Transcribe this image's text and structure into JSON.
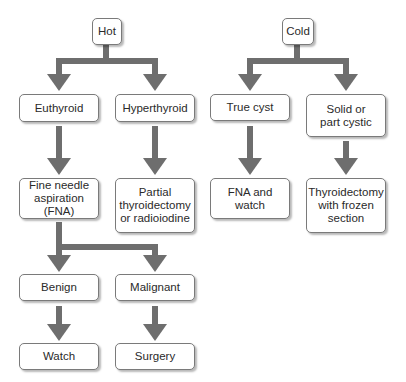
{
  "diagram": {
    "type": "flowchart",
    "arrow_color": "#6e6e6e",
    "box_border_color": "#7a7a7a",
    "nodes": {
      "hot": {
        "label": "Hot"
      },
      "cold": {
        "label": "Cold"
      },
      "euthyroid": {
        "label": "Euthyroid"
      },
      "hyperthyroid": {
        "label": "Hyperthyroid"
      },
      "true_cyst": {
        "label": "True cyst"
      },
      "solid": {
        "label": "Solid or\npart cystic"
      },
      "fna": {
        "label": "Fine needle\naspiration (FNA)"
      },
      "partial": {
        "label": "Partial\nthyroidectomy\nor radioiodine"
      },
      "fna_watch": {
        "label": "FNA and\nwatch"
      },
      "thyroidectomy": {
        "label": "Thyroidectomy\nwith frozen\nsection"
      },
      "benign": {
        "label": "Benign"
      },
      "malignant": {
        "label": "Malignant"
      },
      "watch": {
        "label": "Watch"
      },
      "surgery": {
        "label": "Surgery"
      }
    },
    "edges": [
      {
        "from": "Hot",
        "to": "Euthyroid"
      },
      {
        "from": "Hot",
        "to": "Hyperthyroid"
      },
      {
        "from": "Cold",
        "to": "True cyst"
      },
      {
        "from": "Cold",
        "to": "Solid or part cystic"
      },
      {
        "from": "Euthyroid",
        "to": "Fine needle aspiration (FNA)"
      },
      {
        "from": "Hyperthyroid",
        "to": "Partial thyroidectomy or radioiodine"
      },
      {
        "from": "True cyst",
        "to": "FNA and watch"
      },
      {
        "from": "Solid or part cystic",
        "to": "Thyroidectomy with frozen section"
      },
      {
        "from": "Fine needle aspiration (FNA)",
        "to": "Benign"
      },
      {
        "from": "Fine needle aspiration (FNA)",
        "to": "Malignant"
      },
      {
        "from": "Benign",
        "to": "Watch"
      },
      {
        "from": "Malignant",
        "to": "Surgery"
      }
    ]
  }
}
